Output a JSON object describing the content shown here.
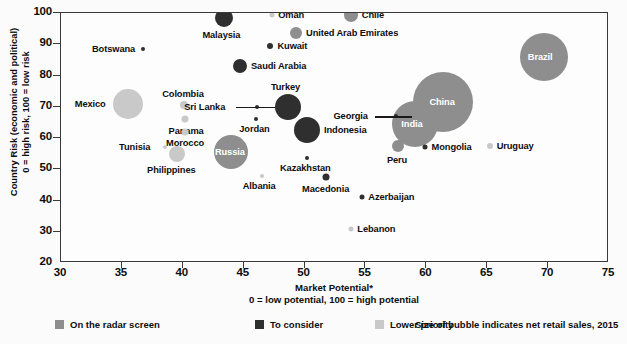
{
  "chart_data": {
    "type": "scatter",
    "title": "",
    "xlabel": "Market Potential*",
    "xlabel_note": "0 = low potential, 100 = high potential",
    "ylabel": "Country Risk (economic and political)",
    "ylabel_note": "0 = high risk, 100 = low risk",
    "xlim": [
      30,
      75
    ],
    "ylim": [
      20,
      100
    ],
    "xticks": [
      30,
      35,
      40,
      45,
      50,
      55,
      60,
      65,
      70,
      75
    ],
    "yticks": [
      20,
      30,
      40,
      50,
      60,
      70,
      80,
      90,
      100
    ],
    "grid": false,
    "size_meaning": "Size of bubble indicates net retail sales, 2015",
    "categories": [
      {
        "key": "radar",
        "label": "On the radar screen",
        "color": "#8e8e8e"
      },
      {
        "key": "consider",
        "label": "To consider",
        "color": "#2f2f2f"
      },
      {
        "key": "lower",
        "label": "Lower priority",
        "color": "#c9c9c9"
      }
    ],
    "points": [
      {
        "name": "Malaysia",
        "x": 43.4,
        "y": 98.5,
        "r": 9,
        "cat": "consider",
        "label_pos": "below"
      },
      {
        "name": "Oman",
        "x": 47.3,
        "y": 99.5,
        "r": 2.5,
        "cat": "lower",
        "label_pos": "right"
      },
      {
        "name": "Chile",
        "x": 53.8,
        "y": 99.5,
        "r": 7,
        "cat": "radar",
        "label_pos": "right"
      },
      {
        "name": "United Arab Emirates",
        "x": 49.3,
        "y": 93.5,
        "r": 6,
        "cat": "radar",
        "label_pos": "right"
      },
      {
        "name": "Kuwait",
        "x": 47.2,
        "y": 89.5,
        "r": 3,
        "cat": "consider",
        "label_pos": "right"
      },
      {
        "name": "Botswana",
        "x": 36.7,
        "y": 88.5,
        "r": 2,
        "cat": "consider",
        "label_pos": "left"
      },
      {
        "name": "Saudi Arabia",
        "x": 44.7,
        "y": 83.0,
        "r": 7,
        "cat": "consider",
        "label_pos": "right"
      },
      {
        "name": "Brazil",
        "x": 69.7,
        "y": 86.0,
        "r": 24,
        "cat": "radar",
        "label_pos": "inside"
      },
      {
        "name": "Mexico",
        "x": 35.5,
        "y": 71.0,
        "r": 15,
        "cat": "lower",
        "label_pos": "left"
      },
      {
        "name": "Colombia",
        "x": 40.1,
        "y": 70.5,
        "r": 4,
        "cat": "lower",
        "label_pos": "above"
      },
      {
        "name": "Turkey",
        "x": 48.6,
        "y": 70.0,
        "r": 13,
        "cat": "consider",
        "label_pos": "above"
      },
      {
        "name": "Sri Lanka",
        "x": 46.1,
        "y": 70.0,
        "r": 2,
        "cat": "consider",
        "label_pos": "leader-left"
      },
      {
        "name": "China",
        "x": 61.4,
        "y": 71.5,
        "r": 30,
        "cat": "radar",
        "label_pos": "inside"
      },
      {
        "name": "Panama",
        "x": 40.2,
        "y": 66.0,
        "r": 3.5,
        "cat": "lower",
        "label_pos": "below"
      },
      {
        "name": "Jordan",
        "x": 46.0,
        "y": 66.0,
        "r": 2,
        "cat": "consider",
        "label_pos": "below"
      },
      {
        "name": "Morocco",
        "x": 40.2,
        "y": 62.0,
        "r": 3.5,
        "cat": "lower",
        "label_pos": "below"
      },
      {
        "name": "Indonesia",
        "x": 50.2,
        "y": 62.5,
        "r": 13,
        "cat": "consider",
        "label_pos": "right"
      },
      {
        "name": "India",
        "x": 59.1,
        "y": 64.5,
        "r": 23,
        "cat": "radar",
        "label_pos": "inside"
      },
      {
        "name": "Georgia",
        "x": 57.5,
        "y": 67.0,
        "r": 2,
        "cat": "consider",
        "label_pos": "leader-left"
      },
      {
        "name": "Tunisia",
        "x": 38.5,
        "y": 57.0,
        "r": 2,
        "cat": "lower",
        "label_pos": "left"
      },
      {
        "name": "Russia",
        "x": 44.0,
        "y": 55.5,
        "r": 17,
        "cat": "radar",
        "label_pos": "inside"
      },
      {
        "name": "Philippines",
        "x": 39.5,
        "y": 55.0,
        "r": 8,
        "cat": "lower",
        "label_pos": "below"
      },
      {
        "name": "Kazakhstan",
        "x": 50.2,
        "y": 53.5,
        "r": 2,
        "cat": "consider",
        "label_pos": "below"
      },
      {
        "name": "Peru",
        "x": 57.7,
        "y": 57.5,
        "r": 6,
        "cat": "radar",
        "label_pos": "below"
      },
      {
        "name": "Mongolia",
        "x": 59.9,
        "y": 57.0,
        "r": 2.5,
        "cat": "consider",
        "label_pos": "right"
      },
      {
        "name": "Uruguay",
        "x": 65.2,
        "y": 57.5,
        "r": 3,
        "cat": "lower",
        "label_pos": "right"
      },
      {
        "name": "Albania",
        "x": 46.5,
        "y": 48.0,
        "r": 2,
        "cat": "lower",
        "label_pos": "below"
      },
      {
        "name": "Macedonia",
        "x": 51.8,
        "y": 47.5,
        "r": 3.5,
        "cat": "consider",
        "label_pos": "below"
      },
      {
        "name": "Azerbaijan",
        "x": 54.7,
        "y": 41.0,
        "r": 2.5,
        "cat": "consider",
        "label_pos": "right"
      },
      {
        "name": "Lebanon",
        "x": 53.8,
        "y": 31.0,
        "r": 2.5,
        "cat": "lower",
        "label_pos": "right"
      }
    ]
  }
}
